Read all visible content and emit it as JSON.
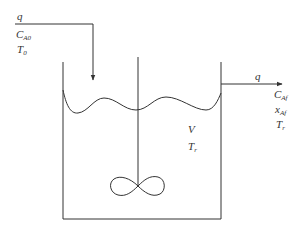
{
  "diagram": {
    "type": "continuous stirred tank reactor",
    "colors": {
      "line": "#333333",
      "background": "#ffffff"
    },
    "inlet": {
      "flow": {
        "main": "q",
        "sub": ""
      },
      "concentration": {
        "main": "C",
        "sub": "A0"
      },
      "temperature": {
        "main": "T",
        "sub": "0"
      }
    },
    "outlet": {
      "flow": {
        "main": "q",
        "sub": ""
      },
      "concentration": {
        "main": "C",
        "sub": "Af"
      },
      "conversion": {
        "main": "x",
        "sub": "Af"
      },
      "temperature": {
        "main": "T",
        "sub": "r"
      }
    },
    "vessel": {
      "volume": {
        "main": "V",
        "sub": ""
      },
      "temperature": {
        "main": "T",
        "sub": "r"
      }
    }
  }
}
